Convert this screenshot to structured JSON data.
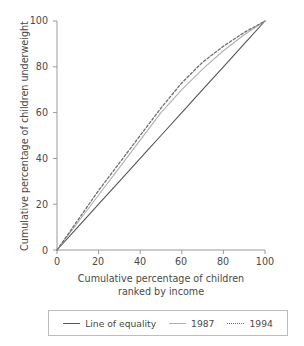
{
  "chart_data": {
    "type": "line",
    "title": "",
    "subtitle": "",
    "xlabel_line1": "Cumulative percentage of children",
    "xlabel_line2": "ranked by income",
    "ylabel": "Cumulative percentage of children underweight",
    "xlim": [
      0,
      100
    ],
    "ylim": [
      0,
      100
    ],
    "xticks": [
      0,
      20,
      40,
      60,
      80,
      100
    ],
    "yticks": [
      0,
      20,
      40,
      60,
      80,
      100
    ],
    "xtick_labels": [
      "0",
      "20",
      "40",
      "60",
      "80",
      "100"
    ],
    "ytick_labels": [
      "0",
      "20",
      "40",
      "60",
      "80",
      "100"
    ],
    "grid": false,
    "legend_position": "below-axes",
    "x": [
      0,
      10,
      20,
      30,
      40,
      45,
      50,
      60,
      70,
      80,
      90,
      100
    ],
    "series": [
      {
        "name": "Line of equality",
        "style": "solid",
        "color": "#555555",
        "values": [
          0,
          10,
          20,
          30,
          40,
          45,
          50,
          60,
          70,
          80,
          90,
          100
        ]
      },
      {
        "name": "1987",
        "style": "solid",
        "color": "#b0b0b0",
        "values": [
          0,
          12,
          24,
          36,
          48,
          54,
          60,
          70,
          79,
          87,
          94,
          100
        ]
      },
      {
        "name": "1994",
        "style": "dotted",
        "color": "#707070",
        "values": [
          0,
          13,
          26,
          38,
          50,
          56,
          62,
          73,
          82,
          89,
          95,
          100
        ]
      }
    ]
  },
  "legend": {
    "items": [
      {
        "label": "Line of equality",
        "color": "#555555",
        "style": "solid"
      },
      {
        "label": "1987",
        "color": "#b0b0b0",
        "style": "solid"
      },
      {
        "label": "1994",
        "color": "#707070",
        "style": "dotted"
      }
    ]
  },
  "axes": {
    "y_tick_0": "0",
    "y_tick_1": "20",
    "y_tick_2": "40",
    "y_tick_3": "60",
    "y_tick_4": "80",
    "y_tick_5": "100",
    "x_tick_0": "0",
    "x_tick_1": "20",
    "x_tick_2": "40",
    "x_tick_3": "60",
    "x_tick_4": "80",
    "x_tick_5": "100"
  },
  "colors": {
    "axis": "#9a9a9a",
    "text": "#4a4a4a",
    "equality_line": "#555555",
    "series_1987": "#b0b0b0",
    "series_1994": "#707070",
    "legend_border": "#bdbdbd",
    "background": "#ffffff"
  }
}
